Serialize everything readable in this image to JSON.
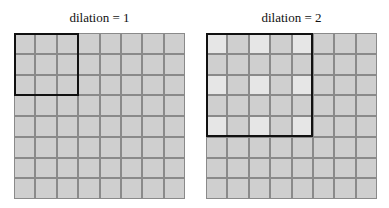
{
  "panels": [
    {
      "title": "dilation = 1",
      "dilation": 1,
      "grid_size": 8,
      "kernel_size": 3,
      "kernel_span": 3,
      "highlighted": []
    },
    {
      "title": "dilation = 2",
      "dilation": 2,
      "grid_size": 8,
      "kernel_size": 3,
      "kernel_span": 5,
      "highlighted": [
        [
          0,
          0
        ],
        [
          0,
          2
        ],
        [
          0,
          4
        ],
        [
          2,
          0
        ],
        [
          2,
          2
        ],
        [
          2,
          4
        ],
        [
          4,
          0
        ],
        [
          4,
          2
        ],
        [
          4,
          4
        ]
      ]
    }
  ],
  "colors": {
    "cell": "#cfcfcf",
    "highlight": "#e6e6e6",
    "gridline": "#8a8a8a",
    "kernel_border": "#111111"
  }
}
